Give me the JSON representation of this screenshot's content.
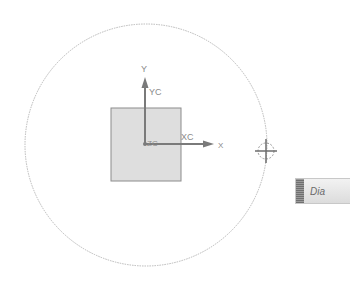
{
  "canvas": {
    "background": "#ffffff",
    "boundary_circle": {
      "cx": 146,
      "cy": 145,
      "r": 121,
      "stroke": "#b8b8b8"
    },
    "square": {
      "x": 111,
      "y": 108,
      "w": 70,
      "h": 73,
      "fill": "#dedede",
      "stroke": "#8c8c8c"
    }
  },
  "axes": {
    "origin": {
      "x": 145,
      "y": 144
    },
    "y_axis_label": "Y",
    "yc_label": "YC",
    "x_axis_label": "X",
    "xc_label": "XC",
    "zc_label": "ZC",
    "color": "#7a7a7a"
  },
  "crosshair": {
    "x": 266,
    "y": 151,
    "icon": "crosshair-target-icon"
  },
  "dialog_tab": {
    "label": "Dia"
  }
}
